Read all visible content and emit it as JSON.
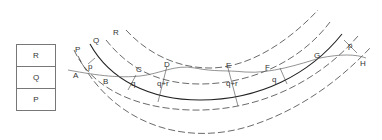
{
  "legend": {
    "cells": [
      "R",
      "Q",
      "P"
    ]
  },
  "curve_labels": {
    "P": "P",
    "Q": "Q",
    "R": "R"
  },
  "points": {
    "A": "A",
    "B": "B",
    "C": "C",
    "D": "D",
    "E": "E",
    "F": "F",
    "G": "G",
    "H": "H"
  },
  "distances": {
    "p_left": "p",
    "q_left": "q",
    "qr_left": "q+r",
    "qr_right": "q+r",
    "q_right": "q",
    "p_right": "p"
  }
}
